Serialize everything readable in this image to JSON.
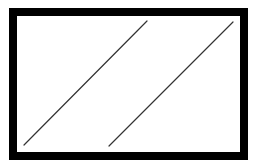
{
  "diagram": {
    "width": 256,
    "height": 162,
    "background": "#ffffff",
    "frame": {
      "outer": {
        "x": 9,
        "y": 8,
        "width": 239,
        "height": 152
      },
      "inner": {
        "x": 17,
        "y": 16,
        "width": 223,
        "height": 136
      },
      "color": "#000000",
      "inner_color": "#ffffff"
    },
    "lines": [
      {
        "id": "diagonal-line-left",
        "x1": 24,
        "y1": 145,
        "x2": 147,
        "y2": 21,
        "color": "#333333",
        "stroke_width": 1.2
      },
      {
        "id": "diagonal-line-right",
        "x1": 109,
        "y1": 146,
        "x2": 233,
        "y2": 22,
        "color": "#333333",
        "stroke_width": 1.2
      }
    ]
  }
}
